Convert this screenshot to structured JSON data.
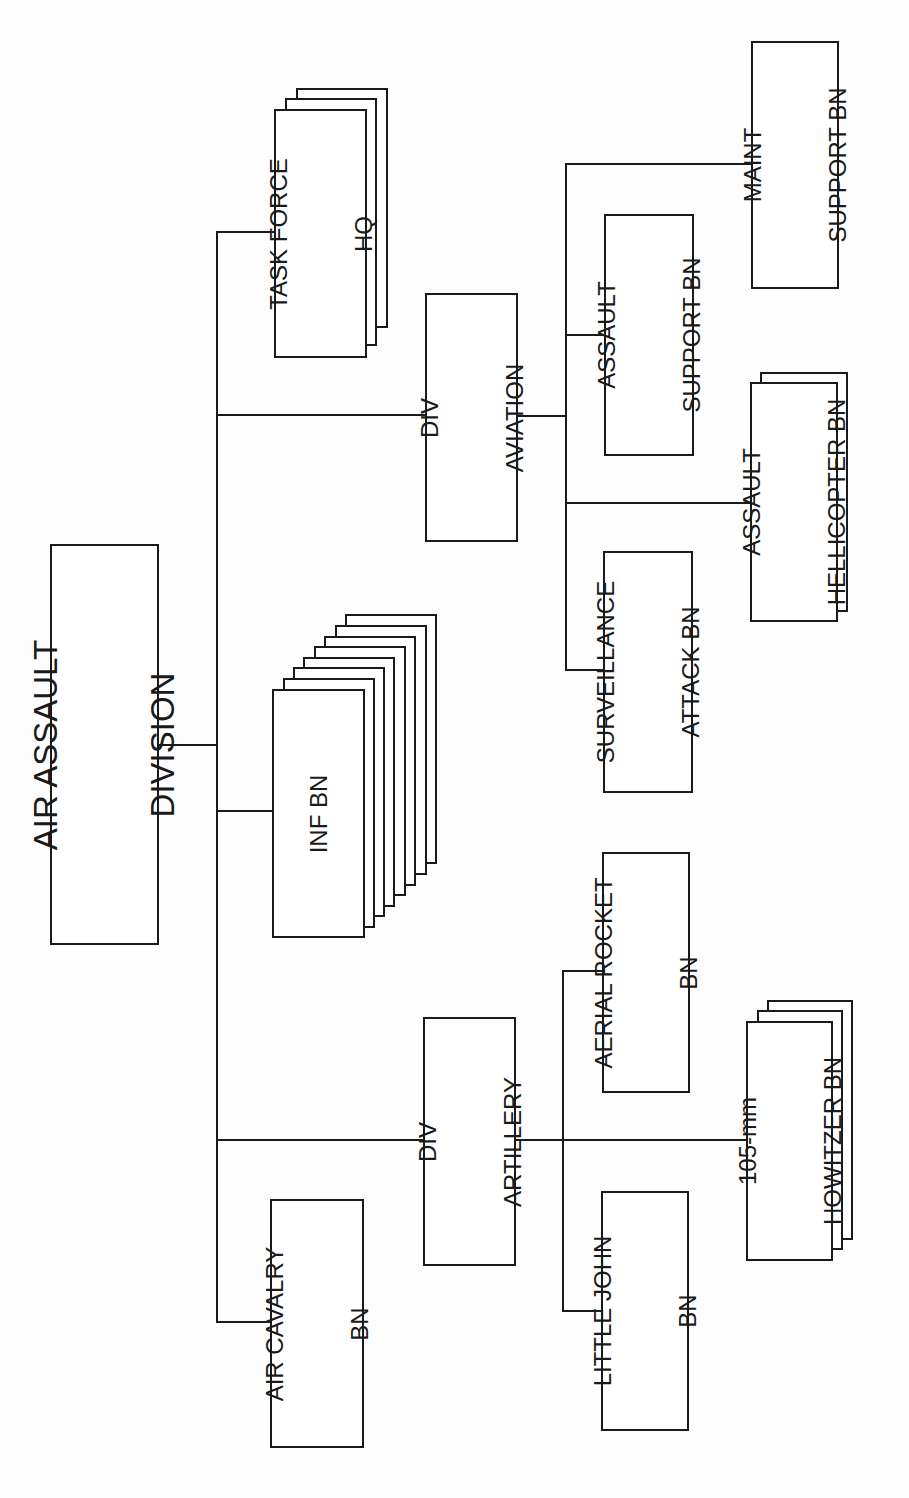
{
  "diagram": {
    "type": "organization-chart",
    "orientation": "rotated-90-ccw",
    "root": {
      "label_lines": [
        "AIR ASSAULT",
        "DIVISION"
      ]
    },
    "units": {
      "task_force_hq": {
        "label_lines": [
          "TASK FORCE",
          "HQ"
        ],
        "stack_count": 3
      },
      "div_aviation": {
        "label_lines": [
          "DIV",
          "AVIATION"
        ]
      },
      "inf_bn": {
        "label_lines": [
          "INF BN"
        ],
        "stack_count": 8
      },
      "div_artillery": {
        "label_lines": [
          "DIV",
          "ARTILLERY"
        ]
      },
      "air_cavalry_bn": {
        "label_lines": [
          "AIR CAVALRY",
          "BN"
        ]
      },
      "maint_support_bn": {
        "label_lines": [
          "MAINT",
          "SUPPORT BN"
        ]
      },
      "assault_support_bn": {
        "label_lines": [
          "ASSAULT",
          "SUPPORT BN"
        ]
      },
      "assault_helicopter_bn": {
        "label_lines": [
          "ASSAULT",
          "HELLICOPTER BN"
        ],
        "stack_count": 2
      },
      "surveillance_attack_bn": {
        "label_lines": [
          "SURVEILLANCE",
          "ATTACK BN"
        ]
      },
      "aerial_rocket_bn": {
        "label_lines": [
          "AERIAL ROCKET",
          "BN"
        ]
      },
      "howitzer_bn": {
        "label_lines": [
          "105-mm",
          "HOWITZER BN"
        ],
        "stack_count": 3
      },
      "little_john_bn": {
        "label_lines": [
          "LITTLE JOHN",
          "BN"
        ]
      }
    },
    "hierarchy": [
      {
        "parent": "AIR ASSAULT DIVISION",
        "children": [
          "TASK FORCE HQ",
          "DIV AVIATION",
          "INF BN",
          "DIV ARTILLERY",
          "AIR CAVALRY BN"
        ]
      },
      {
        "parent": "DIV AVIATION",
        "children": [
          "MAINT SUPPORT BN",
          "ASSAULT SUPPORT BN",
          "ASSAULT HELLICOPTER BN",
          "SURVEILLANCE ATTACK BN"
        ]
      },
      {
        "parent": "DIV ARTILLERY",
        "children": [
          "AERIAL ROCKET BN",
          "105-mm HOWITZER BN",
          "LITTLE JOHN BN"
        ]
      }
    ],
    "colors": {
      "line": "#1a1a1a",
      "background": "#ffffff"
    }
  }
}
